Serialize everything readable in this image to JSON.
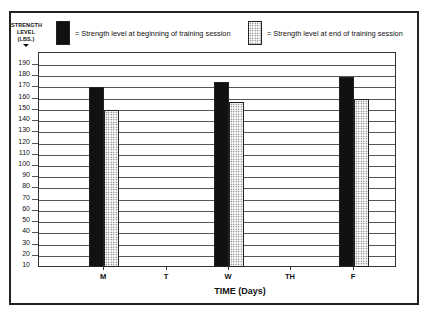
{
  "chart_data": {
    "type": "bar",
    "title": "",
    "ylabel": "STRENGTH LEVEL (LBS.)",
    "xlabel": "TIME (Days)",
    "categories": [
      "M",
      "T",
      "W",
      "TH",
      "F"
    ],
    "series": [
      {
        "name": "Strength level at beginning of training session",
        "pattern": "solid-black",
        "values": [
          170,
          null,
          175,
          null,
          179
        ]
      },
      {
        "name": "Strength level at end of training session",
        "pattern": "dotted",
        "values": [
          150,
          null,
          157,
          null,
          160
        ]
      }
    ],
    "ylim": [
      10,
      190
    ],
    "yticks": [
      10,
      20,
      30,
      40,
      50,
      60,
      70,
      80,
      90,
      100,
      110,
      120,
      130,
      140,
      150,
      160,
      170,
      180,
      190
    ],
    "grid": true,
    "legend_position": "top"
  },
  "ylabel_lines": [
    "STRENGTH",
    "LEVEL",
    "(LBS.)"
  ],
  "legend": {
    "begin_text": "= Strength level at beginning of training session",
    "end_text": "=  Strength level at end of training session"
  },
  "xtitle": "TIME (Days)",
  "colors": {
    "dark_bar": "#111111",
    "dotted_bar_dots": "#555555",
    "frame": "#222222"
  }
}
